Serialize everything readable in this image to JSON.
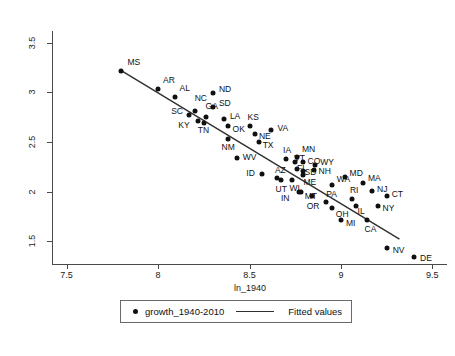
{
  "chart_data": {
    "type": "scatter",
    "title": "",
    "xlabel": "ln_1940",
    "ylabel": "",
    "xlim": [
      7.42,
      9.58
    ],
    "ylim": [
      1.27,
      3.62
    ],
    "xticks": [
      "7.5",
      "8",
      "8.5",
      "9",
      "9.5"
    ],
    "xtick_values": [
      7.5,
      8,
      8.5,
      9,
      9.5
    ],
    "yticks": [
      "1.5",
      "2",
      "2.5",
      "3",
      "3.5"
    ],
    "ytick_values": [
      1.5,
      2,
      2.5,
      3,
      3.5
    ],
    "grid": false,
    "legend_position": "below-axis",
    "series": [
      {
        "name": "growth_1940-2010",
        "type": "scatter",
        "marker": "filled-circle",
        "color": "#101010",
        "points": [
          {
            "label": "MS",
            "x": 7.8,
            "y": 3.22,
            "lx": 6,
            "ly": -9
          },
          {
            "label": "AR",
            "x": 8.0,
            "y": 3.03,
            "lx": 5,
            "ly": -9
          },
          {
            "label": "AL",
            "x": 8.09,
            "y": 2.95,
            "lx": 5,
            "ly": -9
          },
          {
            "label": "ND",
            "x": 8.3,
            "y": 2.99,
            "lx": 6,
            "ly": -4
          },
          {
            "label": "NC",
            "x": 8.2,
            "y": 2.81,
            "lx": 0,
            "ly": -13
          },
          {
            "label": "SD",
            "x": 8.3,
            "y": 2.85,
            "lx": 6,
            "ly": -4
          },
          {
            "label": "SC",
            "x": 8.17,
            "y": 2.77,
            "lx": -18,
            "ly": -4
          },
          {
            "label": "GA",
            "x": 8.26,
            "y": 2.75,
            "lx": 0,
            "ly": -11
          },
          {
            "label": "LA",
            "x": 8.36,
            "y": 2.73,
            "lx": 6,
            "ly": -3
          },
          {
            "label": "KY",
            "x": 8.22,
            "y": 2.71,
            "lx": -20,
            "ly": 4
          },
          {
            "label": "TN",
            "x": 8.25,
            "y": 2.69,
            "lx": -6,
            "ly": 7
          },
          {
            "label": "OK",
            "x": 8.38,
            "y": 2.66,
            "lx": 5,
            "ly": 3
          },
          {
            "label": "KS",
            "x": 8.5,
            "y": 2.66,
            "lx": -2,
            "ly": -9
          },
          {
            "label": "VA",
            "x": 8.62,
            "y": 2.62,
            "lx": 6,
            "ly": -2
          },
          {
            "label": "NE",
            "x": 8.53,
            "y": 2.58,
            "lx": 4,
            "ly": 2
          },
          {
            "label": "TX",
            "x": 8.55,
            "y": 2.5,
            "lx": 4,
            "ly": 3
          },
          {
            "label": "NM",
            "x": 8.38,
            "y": 2.53,
            "lx": -6,
            "ly": 8
          },
          {
            "label": "WV",
            "x": 8.43,
            "y": 2.34,
            "lx": 6,
            "ly": -1
          },
          {
            "label": "IA",
            "x": 8.7,
            "y": 2.33,
            "lx": -3,
            "ly": -9
          },
          {
            "label": "MN",
            "x": 8.76,
            "y": 2.35,
            "lx": 5,
            "ly": -8
          },
          {
            "label": "VT",
            "x": 8.75,
            "y": 2.3,
            "lx": -1,
            "ly": -4
          },
          {
            "label": "CO",
            "x": 8.79,
            "y": 2.3,
            "lx": 5,
            "ly": -1
          },
          {
            "label": "WY",
            "x": 8.86,
            "y": 2.27,
            "lx": 5,
            "ly": -3
          },
          {
            "label": "ID",
            "x": 8.57,
            "y": 2.18,
            "lx": -16,
            "ly": -1
          },
          {
            "label": "AZ",
            "x": 8.65,
            "y": 2.14,
            "lx": -2,
            "ly": -8
          },
          {
            "label": "FL",
            "x": 8.76,
            "y": 2.23,
            "lx": 0,
            "ly": -1
          },
          {
            "label": "SD2",
            "x": 8.79,
            "y": 2.21,
            "lx": 2,
            "ly": 1
          },
          {
            "label": "NH",
            "x": 8.85,
            "y": 2.22,
            "lx": 5,
            "ly": 1
          },
          {
            "label": "UT",
            "x": 8.67,
            "y": 2.12,
            "lx": -5,
            "ly": 9
          },
          {
            "label": "WI",
            "x": 8.73,
            "y": 2.12,
            "lx": -2,
            "ly": 8
          },
          {
            "label": "ME",
            "x": 8.79,
            "y": 2.17,
            "lx": 1,
            "ly": 7
          },
          {
            "label": "WA",
            "x": 8.95,
            "y": 2.07,
            "lx": 5,
            "ly": -6
          },
          {
            "label": "MD",
            "x": 9.02,
            "y": 2.15,
            "lx": 5,
            "ly": -4
          },
          {
            "label": "MA",
            "x": 9.12,
            "y": 2.09,
            "lx": 5,
            "ly": -5
          },
          {
            "label": "NJ",
            "x": 9.17,
            "y": 2.01,
            "lx": 5,
            "ly": -2
          },
          {
            "label": "CT",
            "x": 9.25,
            "y": 1.96,
            "lx": 5,
            "ly": -2
          },
          {
            "label": "MT",
            "x": 8.78,
            "y": 2.0,
            "lx": 4,
            "ly": 4
          },
          {
            "label": "IN",
            "x": 8.77,
            "y": 2.0,
            "lx": -18,
            "ly": 6
          },
          {
            "label": "OR",
            "x": 8.84,
            "y": 1.96,
            "lx": -5,
            "ly": 10
          },
          {
            "label": "PA",
            "x": 8.92,
            "y": 1.9,
            "lx": 0,
            "ly": -8
          },
          {
            "label": "RI",
            "x": 9.06,
            "y": 1.93,
            "lx": -2,
            "ly": -9
          },
          {
            "label": "IL",
            "x": 9.08,
            "y": 1.86,
            "lx": 2,
            "ly": 5
          },
          {
            "label": "NY",
            "x": 9.2,
            "y": 1.85,
            "lx": 5,
            "ly": 2
          },
          {
            "label": "OH",
            "x": 8.95,
            "y": 1.83,
            "lx": 4,
            "ly": 6
          },
          {
            "label": "MI",
            "x": 9.0,
            "y": 1.71,
            "lx": 5,
            "ly": 3
          },
          {
            "label": "CA",
            "x": 9.14,
            "y": 1.71,
            "lx": -2,
            "ly": 9
          },
          {
            "label": "NV",
            "x": 9.25,
            "y": 1.43,
            "lx": 6,
            "ly": 2
          },
          {
            "label": "DE",
            "x": 9.4,
            "y": 1.34,
            "lx": 6,
            "ly": 1
          }
        ]
      },
      {
        "name": "Fitted values",
        "type": "line",
        "color": "#303030",
        "x0": 7.79,
        "y0": 3.23,
        "x1": 9.32,
        "y1": 1.52
      }
    ]
  },
  "legend": {
    "scatter_label": "growth_1940-2010",
    "fit_label": "Fitted values"
  }
}
